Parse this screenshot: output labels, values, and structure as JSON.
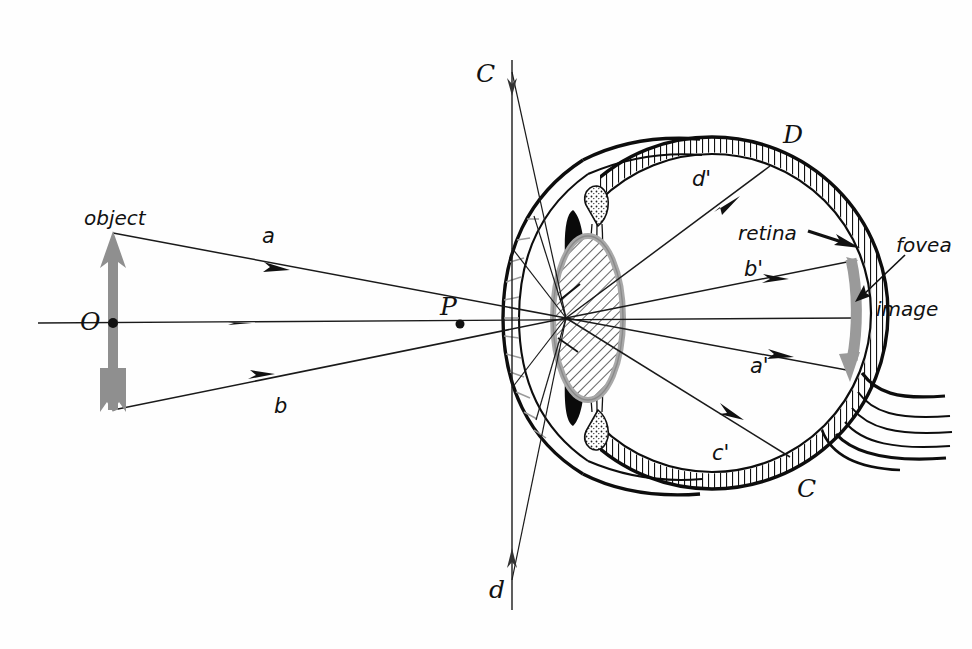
{
  "figure": {
    "kind": "optics-diagram",
    "background_color": "#fefefe",
    "ink_color": "#111111",
    "accent_gray": "#8f8f8f",
    "lens_fill": "#b9b9b9"
  },
  "labels": {
    "object": "object",
    "O": "O",
    "P": "P",
    "C_top": "C",
    "C_bottom": "C",
    "D": "D",
    "d_bottom": "d",
    "ray_a": "a",
    "ray_b": "b",
    "ray_a_prime": "a'",
    "ray_b_prime": "b'",
    "ray_c_prime": "c'",
    "ray_d_prime": "d'",
    "retina": "retina",
    "fovea": "fovea",
    "image": "image"
  },
  "annotations": {
    "object_arrow": {
      "name": "object-arrow",
      "description": "upright gray arrow at left representing the object",
      "color": "#8f8f8f",
      "orientation": "up"
    },
    "image_arrow": {
      "name": "image-arrow",
      "description": "inverted gray arrow on the retina representing the image",
      "color": "#9a9a9a",
      "orientation": "down"
    },
    "nodal_point": {
      "name": "nodal-point",
      "description": "ray convergence point inside the lens"
    },
    "optic_nerve": {
      "name": "optic-nerve",
      "description": "striated bundle exiting lower right of the globe"
    },
    "lens": {
      "name": "crystalline-lens",
      "description": "hatched ellipse with gray border"
    },
    "iris": {
      "name": "iris",
      "description": "solid black elongated wedges above and below the lens"
    },
    "ciliary_body": {
      "name": "ciliary-body",
      "description": "stippled region at the lens periphery"
    },
    "retina_layer": {
      "name": "retina-layer",
      "description": "hatched band lining the inside of the globe"
    },
    "fovea_spot": {
      "name": "fovea-spot",
      "description": "point on the retina at the posterior pole"
    }
  },
  "geometry": {
    "optical_axis_y": 323,
    "object_x": 113,
    "object_top_y": 233,
    "object_bottom_y": 410,
    "nodal_point": {
      "x": 566,
      "y": 318
    },
    "P_point": {
      "x": 460,
      "y": 323
    },
    "vertical_line_x": 512,
    "globe_center": {
      "x": 712,
      "y": 313
    },
    "globe_radius": 175
  },
  "rays": [
    {
      "id": "a",
      "label": "a",
      "from": "object-tip",
      "to": "nodal-point"
    },
    {
      "id": "b",
      "label": "b",
      "from": "object-tail",
      "to": "nodal-point"
    },
    {
      "id": "a'",
      "label": "a'",
      "from": "nodal-point",
      "to": "retina-lower"
    },
    {
      "id": "b'",
      "label": "b'",
      "from": "nodal-point",
      "to": "retina-upper"
    },
    {
      "id": "c'",
      "label": "c'",
      "from": "nodal-point",
      "to": "retina-lower-far"
    },
    {
      "id": "d'",
      "label": "d'",
      "from": "nodal-point",
      "to": "retina-upper-far"
    },
    {
      "id": "C",
      "label": "C",
      "from": "vertical-top",
      "to": "nodal-point"
    },
    {
      "id": "d",
      "label": "d",
      "from": "vertical-bottom",
      "to": "nodal-point"
    }
  ]
}
